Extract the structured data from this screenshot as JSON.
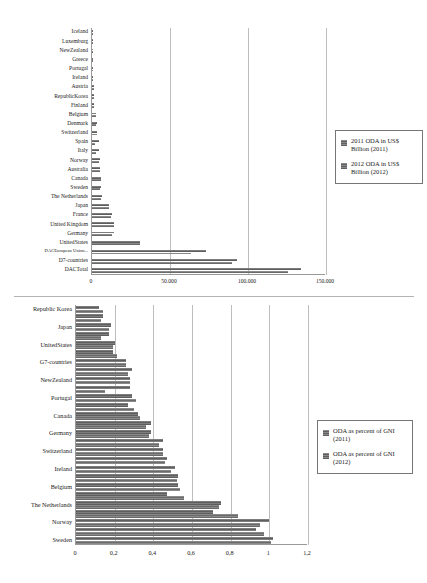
{
  "chart_data": [
    {
      "id": "oda-absolute",
      "type": "bar",
      "orientation": "horizontal",
      "title": "",
      "xlabel": "",
      "ylabel": "",
      "xlim": [
        0,
        150000
      ],
      "xticks": [
        "0",
        "50.000",
        "100.000",
        "150.000"
      ],
      "xtick_values": [
        0,
        50000,
        100000,
        150000
      ],
      "grid": true,
      "legend_position": "right",
      "categories": [
        "Iceland",
        "Luxemburg",
        "NewZealand",
        "Greece",
        "Portugal",
        "Ireland",
        "Austria",
        "RepublicKorea",
        "Finland",
        "Belgium",
        "Denmark",
        "Switzerland",
        "Spain",
        "Italy",
        "Norway",
        "Australia",
        "Canada",
        "Sweden",
        "The Netherlands",
        "Japan",
        "France",
        "United Kingdom",
        "Germany",
        "UnitedStates",
        "DACEuropean Union...",
        "D7-countries",
        "DACTotal"
      ],
      "series": [
        {
          "name": "2011 ODA in US$ Billion (2011)",
          "values": [
            26,
            409,
            424,
            425,
            708,
            914,
            1111,
            1325,
            1406,
            2807,
            2931,
            3076,
            4173,
            4326,
            4934,
            4983,
            5457,
            5603,
            6344,
            10831,
            12997,
            13832,
            14093,
            30924,
            72807,
            92723,
            133713
          ]
        },
        {
          "name": "2012 ODA in US$ Billion (2012)",
          "values": [
            26,
            399,
            449,
            324,
            581,
            808,
            1106,
            1597,
            1320,
            2315,
            2693,
            3022,
            2037,
            2737,
            4753,
            5440,
            5650,
            5240,
            5523,
            10605,
            12028,
            13891,
            12939,
            30687,
            63712,
            89743,
            125692
          ]
        }
      ]
    },
    {
      "id": "oda-percent-gni",
      "type": "bar",
      "orientation": "horizontal",
      "title": "",
      "xlabel": "",
      "ylabel": "",
      "xlim": [
        0,
        1.2
      ],
      "xticks": [
        "0",
        "0,2",
        "0,4",
        "0,6",
        "0,8",
        "1",
        "1,2"
      ],
      "xtick_values": [
        0,
        0.2,
        0.4,
        0.6,
        0.8,
        1.0,
        1.2
      ],
      "grid": true,
      "legend_position": "right",
      "categories": [
        "Republic Korea",
        "",
        "Japan",
        "",
        "UnitedStates",
        "",
        "G7-countries",
        "",
        "NewZealand",
        "",
        "Portugal",
        "",
        "Canada",
        "",
        "Germany",
        "",
        "Switzerland",
        "",
        "Ireland",
        "",
        "Belgium",
        "",
        "The Netherlands",
        "",
        "Norway",
        "",
        "Sweden"
      ],
      "series": [
        {
          "name": "ODA as percent of GNI (2011)",
          "values": [
            0.12,
            0.14,
            0.18,
            0.17,
            0.2,
            0.19,
            0.26,
            0.29,
            0.28,
            0.28,
            0.29,
            0.27,
            0.32,
            0.39,
            0.39,
            0.45,
            0.45,
            0.47,
            0.51,
            0.53,
            0.53,
            0.47,
            0.75,
            0.71,
            1.0,
            0.93,
            1.02
          ]
        },
        {
          "name": "ODA as percent of GNI (2012)",
          "values": [
            0.14,
            0.13,
            0.17,
            0.13,
            0.19,
            0.21,
            0.26,
            0.27,
            0.28,
            0.15,
            0.31,
            0.3,
            0.33,
            0.36,
            0.38,
            0.43,
            0.45,
            0.46,
            0.49,
            0.52,
            0.54,
            0.56,
            0.74,
            0.84,
            0.95,
            0.97,
            1.01
          ]
        }
      ]
    }
  ],
  "top_chart": {
    "legend": {
      "items": [
        "2011 ODA in US$ Billion (2011)",
        "2012 ODA in US$ Billion (2012)"
      ]
    }
  },
  "bottom_chart": {
    "legend": {
      "items": [
        "ODA as percent of GNI (2011)",
        "ODA as percent of GNI (2012)"
      ]
    }
  }
}
